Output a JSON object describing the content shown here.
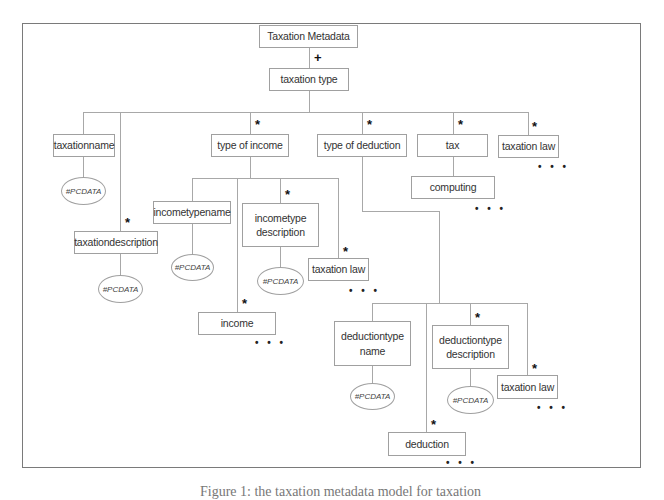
{
  "diagram": {
    "root": "Taxation Metadata",
    "root_cardinality": "+",
    "level1": "taxation type",
    "children": {
      "taxationname": {
        "label": "taxationname",
        "content": "#PCDATA"
      },
      "taxationdescription": {
        "label": "taxationdescription",
        "cardinality": "*",
        "content": "#PCDATA"
      },
      "type_of_income": {
        "label": "type of income",
        "cardinality": "*",
        "children": {
          "incometypename": {
            "label": "incometypename",
            "content": "#PCDATA"
          },
          "income": {
            "label": "income",
            "cardinality": "*",
            "more": "• • •"
          },
          "incometype_description": {
            "label_line1": "incometype",
            "label_line2": "description",
            "cardinality": "*",
            "content": "#PCDATA"
          },
          "taxation_law": {
            "label": "taxation law",
            "cardinality": "*",
            "more": "• • •"
          }
        }
      },
      "type_of_deduction": {
        "label": "type of deduction",
        "cardinality": "*",
        "children": {
          "deductiontype_name": {
            "label_line1": "deductiontype",
            "label_line2": "name",
            "content": "#PCDATA"
          },
          "deduction": {
            "label": "deduction",
            "cardinality": "*",
            "more": "• • •"
          },
          "deductiontype_description": {
            "label_line1": "deductiontype",
            "label_line2": "description",
            "cardinality": "*",
            "content": "#PCDATA"
          },
          "taxation_law": {
            "label": "taxation law",
            "cardinality": "*",
            "more": "• • •"
          }
        }
      },
      "tax": {
        "label": "tax",
        "cardinality": "*",
        "children": {
          "computing": {
            "label": "computing",
            "more": "• • •"
          }
        }
      },
      "taxation_law": {
        "label": "taxation law",
        "cardinality": "*",
        "more": "• • •"
      }
    }
  },
  "caption": "Figure 1: the taxation metadata model for taxation"
}
